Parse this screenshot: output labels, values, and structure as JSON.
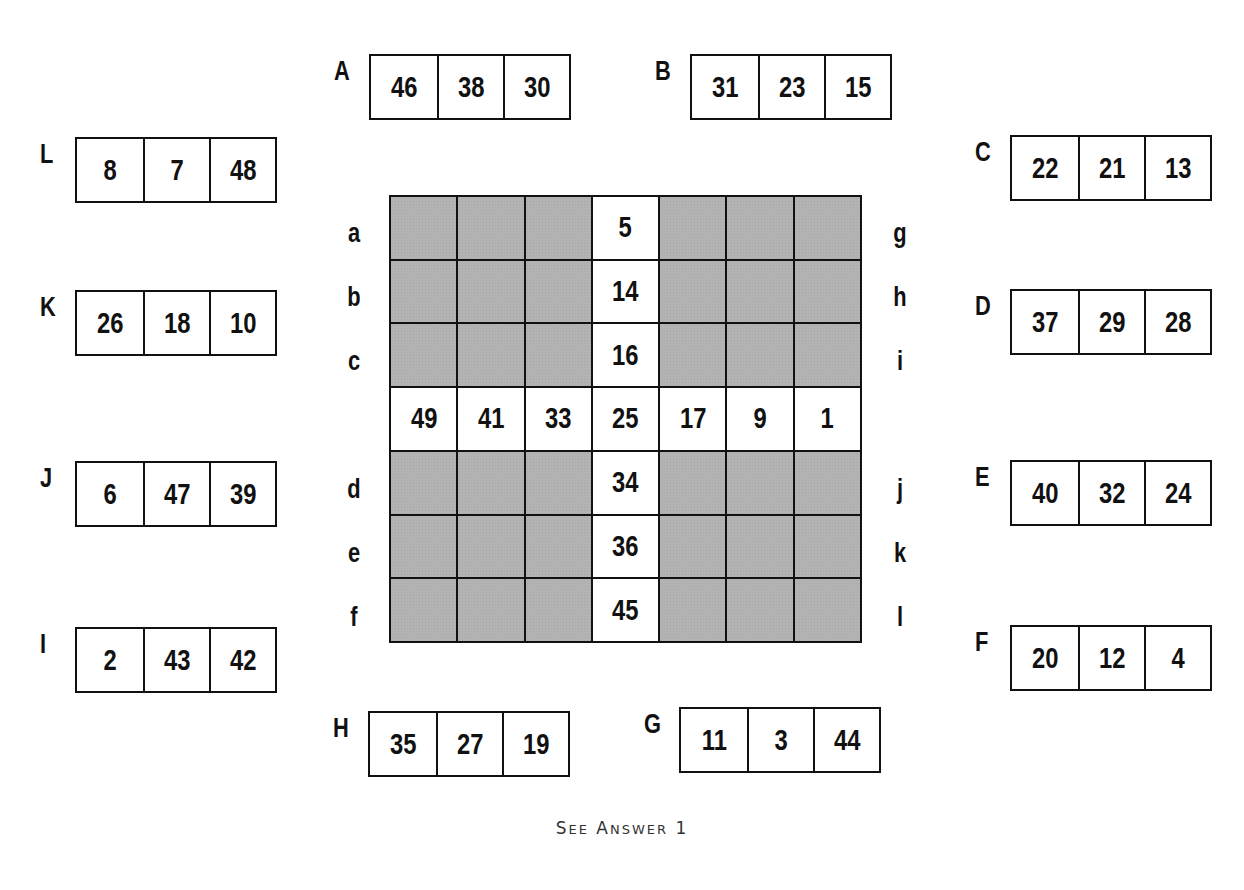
{
  "puzzle": {
    "clues": [
      {
        "label": "A",
        "values": [
          "46",
          "38",
          "30"
        ]
      },
      {
        "label": "B",
        "values": [
          "31",
          "23",
          "15"
        ]
      },
      {
        "label": "C",
        "values": [
          "22",
          "21",
          "13"
        ]
      },
      {
        "label": "D",
        "values": [
          "37",
          "29",
          "28"
        ]
      },
      {
        "label": "E",
        "values": [
          "40",
          "32",
          "24"
        ]
      },
      {
        "label": "F",
        "values": [
          "20",
          "12",
          "4"
        ]
      },
      {
        "label": "G",
        "values": [
          "11",
          "3",
          "44"
        ]
      },
      {
        "label": "H",
        "values": [
          "35",
          "27",
          "19"
        ]
      },
      {
        "label": "I",
        "values": [
          "2",
          "43",
          "42"
        ]
      },
      {
        "label": "J",
        "values": [
          "6",
          "47",
          "39"
        ]
      },
      {
        "label": "K",
        "values": [
          "26",
          "18",
          "10"
        ]
      },
      {
        "label": "L",
        "values": [
          "8",
          "7",
          "48"
        ]
      }
    ],
    "grid": {
      "rows": 7,
      "cols": 7,
      "cells": [
        [
          "",
          "",
          "",
          "5",
          "",
          "",
          ""
        ],
        [
          "",
          "",
          "",
          "14",
          "",
          "",
          ""
        ],
        [
          "",
          "",
          "",
          "16",
          "",
          "",
          ""
        ],
        [
          "49",
          "41",
          "33",
          "25",
          "17",
          "9",
          "1"
        ],
        [
          "",
          "",
          "",
          "34",
          "",
          "",
          ""
        ],
        [
          "",
          "",
          "",
          "36",
          "",
          "",
          ""
        ],
        [
          "",
          "",
          "",
          "45",
          "",
          "",
          ""
        ]
      ],
      "open_row": 3,
      "open_col": 3,
      "left_row_labels": [
        "a",
        "b",
        "c",
        "",
        "d",
        "e",
        "f"
      ],
      "right_row_labels": [
        "g",
        "h",
        "i",
        "",
        "j",
        "k",
        "l"
      ]
    },
    "caption": {
      "text": "SEE ANSWER 1",
      "word1_initial": "S",
      "word1_rest": "EE",
      "word2_initial": "A",
      "word2_rest": "NSWER",
      "number": "1"
    },
    "colors": {
      "shaded_cell": "#b3b3b3",
      "border": "#111111",
      "background": "#ffffff"
    }
  }
}
